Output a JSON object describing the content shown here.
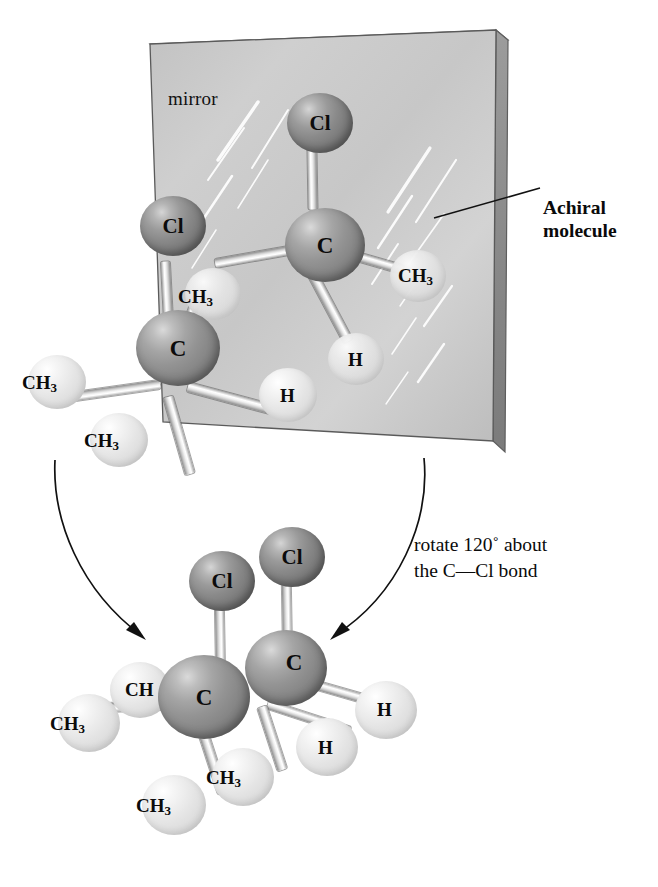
{
  "figure": {
    "type": "chemistry-stereochemistry-diagram"
  },
  "mirror": {
    "label": "mirror",
    "surface_color": "#cfcfcf",
    "edge_color": "#8a8a8a"
  },
  "callout": {
    "line1": "Achiral",
    "line2": "molecule"
  },
  "rotation_note": {
    "line1": "rotate 120˚ about",
    "line2": "the C—Cl bond"
  },
  "colors": {
    "chlorine": "#7c7c7c",
    "carbon": "#8d8d8d",
    "hydrogen": "#e6e6e6",
    "methyl": "#e6e6e6",
    "bond": "#ededed",
    "text": "#0b0b0b",
    "background": "#ffffff"
  },
  "atom_labels": {
    "cl": "Cl",
    "c": "C",
    "h": "H",
    "ch3_text": "CH",
    "ch3_sub": "3",
    "ch_partial": "CH"
  },
  "top_molecule_front": {
    "name": "achiral molecule (in front of mirror)",
    "atoms": [
      {
        "id": "C",
        "label": "C",
        "kind": "carbon"
      },
      {
        "id": "Cl",
        "label": "Cl",
        "kind": "chlorine"
      },
      {
        "id": "CH3-left",
        "label": "CH3",
        "kind": "methyl"
      },
      {
        "id": "CH3-up",
        "label": "CH3",
        "kind": "methyl"
      },
      {
        "id": "CH3-down",
        "label": "CH3",
        "kind": "methyl"
      },
      {
        "id": "H",
        "label": "H",
        "kind": "hydrogen"
      }
    ]
  },
  "top_molecule_reflection": {
    "name": "mirror image (reflected in mirror)",
    "atoms": [
      {
        "id": "C",
        "label": "C",
        "kind": "carbon"
      },
      {
        "id": "Cl",
        "label": "Cl",
        "kind": "chlorine"
      },
      {
        "id": "CH3-right",
        "label": "CH3",
        "kind": "methyl"
      },
      {
        "id": "CH3-left",
        "label": "CH3",
        "kind": "methyl"
      },
      {
        "id": "H",
        "label": "H",
        "kind": "hydrogen"
      }
    ]
  },
  "bottom_molecule": {
    "name": "the two structures superimposed after rotation",
    "atoms": [
      {
        "id": "Cl-left",
        "label": "Cl",
        "kind": "chlorine"
      },
      {
        "id": "Cl-right",
        "label": "Cl",
        "kind": "chlorine"
      },
      {
        "id": "C-left",
        "label": "C",
        "kind": "carbon"
      },
      {
        "id": "C-right",
        "label": "C",
        "kind": "carbon"
      },
      {
        "id": "CH-partial",
        "label": "CH",
        "kind": "methyl"
      },
      {
        "id": "CH3-far-left",
        "label": "CH3",
        "kind": "methyl"
      },
      {
        "id": "CH3-bottom-left",
        "label": "CH3",
        "kind": "methyl"
      },
      {
        "id": "CH3-bottom-mid",
        "label": "CH3",
        "kind": "methyl"
      },
      {
        "id": "H-mid",
        "label": "H",
        "kind": "hydrogen"
      },
      {
        "id": "H-right",
        "label": "H",
        "kind": "hydrogen"
      }
    ]
  },
  "arrows": [
    {
      "id": "left-arrow",
      "direction": "curves down and right into the bottom structure"
    },
    {
      "id": "right-arrow",
      "direction": "curves down and left into the bottom structure"
    }
  ]
}
